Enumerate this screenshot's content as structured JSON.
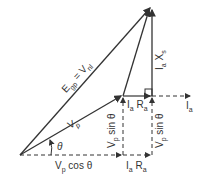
{
  "diagram": {
    "type": "phasor-diagram",
    "labels": {
      "egp": "E",
      "egp_sub": "gp",
      "eq": " = V",
      "vnl_sub": "nl",
      "vp": "V",
      "vp_sub": "p",
      "theta": "θ",
      "vp_cos": "V",
      "vp_cos_sub": "p",
      "vp_cos_text": " cos θ",
      "iara_bottom": "I",
      "iara_bottom_sub": "a",
      "iara_bottom_r": " R",
      "iara_bottom_rsub": "a",
      "iara_top": "I",
      "iara_top_sub": "a",
      "iara_top_r": " R",
      "iara_top_rsub": "a",
      "ia": "I",
      "ia_sub": "a",
      "iaxs": "I",
      "iaxs_sub": "a",
      "iaxs_x": " X",
      "iaxs_xsub": "s",
      "vpsin_left": "V",
      "vpsin_left_sub": "p",
      "vpsin_left_text": " sin θ",
      "vpsin_right": "V",
      "vpsin_right_sub": "p",
      "vpsin_right_text": " sin θ"
    },
    "color": "#333333"
  }
}
